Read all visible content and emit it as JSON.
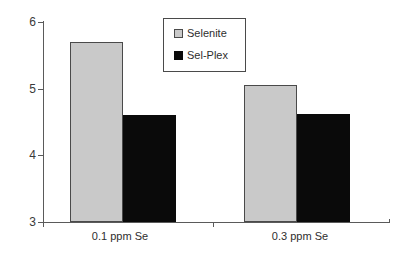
{
  "chart_data": {
    "type": "bar",
    "title": "",
    "subtitle": "",
    "xlabel": "",
    "ylabel": "",
    "categories": [
      "0.1 ppm Se",
      "0.3 ppm Se"
    ],
    "series": [
      {
        "name": "Selenite",
        "color": "#c9c9c9",
        "values": [
          5.7,
          5.05
        ]
      },
      {
        "name": "Sel-Plex",
        "color": "#0a0a0a",
        "values": [
          4.61,
          4.62
        ]
      }
    ],
    "ylim": [
      3,
      6
    ],
    "yticks": [
      3,
      4,
      5,
      6
    ],
    "ytick_labels": [
      "3",
      "4",
      "5",
      "6"
    ],
    "grid": false,
    "legend_position": "top-center",
    "axis_color": "#5a5a5a",
    "background": "#ffffff"
  },
  "legend": {
    "entries": [
      {
        "label": "Selenite",
        "swatch": "legend-swatch-selenite"
      },
      {
        "label": "Sel-Plex",
        "swatch": "legend-swatch-selplex"
      }
    ]
  },
  "axes": {
    "y": {
      "tick_labels": [
        "6",
        "5",
        "4",
        "3"
      ]
    },
    "x": {
      "tick_labels": [
        "0.1 ppm Se",
        "0.3 ppm Se"
      ]
    }
  }
}
